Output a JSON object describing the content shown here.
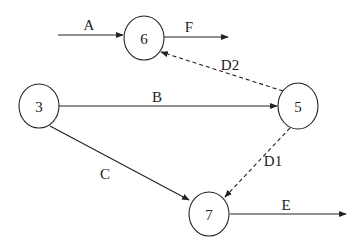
{
  "diagram": {
    "type": "activity-on-arrow network",
    "nodes": [
      {
        "id": "n6",
        "label": "6"
      },
      {
        "id": "n3",
        "label": "3"
      },
      {
        "id": "n5",
        "label": "5"
      },
      {
        "id": "n7",
        "label": "7"
      }
    ],
    "edges": [
      {
        "id": "A",
        "label": "A",
        "from": null,
        "to": "6",
        "style": "solid"
      },
      {
        "id": "F",
        "label": "F",
        "from": "6",
        "to": null,
        "style": "solid"
      },
      {
        "id": "B",
        "label": "B",
        "from": "3",
        "to": "5",
        "style": "solid"
      },
      {
        "id": "C",
        "label": "C",
        "from": "3",
        "to": "7",
        "style": "solid"
      },
      {
        "id": "D2",
        "label": "D2",
        "from": "5",
        "to": "6",
        "style": "dashed"
      },
      {
        "id": "D1",
        "label": "D1",
        "from": "5",
        "to": "7",
        "style": "dashed"
      },
      {
        "id": "E",
        "label": "E",
        "from": "7",
        "to": null,
        "style": "solid"
      }
    ]
  }
}
